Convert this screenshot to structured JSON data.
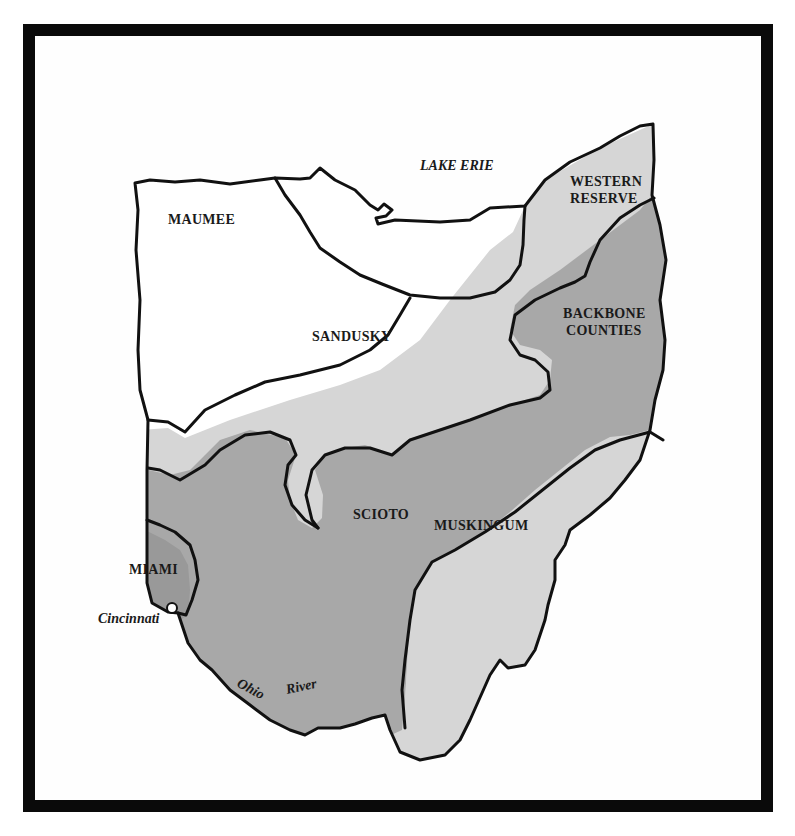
{
  "map": {
    "title": "Ohio settlement regions",
    "colors": {
      "white_region": "#ffffff",
      "light_region": "#d9d9d9",
      "medium_region": "#a9a9a9",
      "dark_region": "#9a9a9a",
      "line": "#111111",
      "frame": "#0a0a0a"
    },
    "water_labels": {
      "lake": "LAKE ERIE",
      "river_part1": "Ohio",
      "river_part2": "River"
    },
    "city_labels": {
      "cincinnati": "Cincinnati"
    },
    "regions": [
      {
        "id": "maumee",
        "label": "MAUMEE",
        "shade": "white"
      },
      {
        "id": "sandusky",
        "label": "SANDUSKY",
        "shade": "white"
      },
      {
        "id": "western-reserve",
        "label_line1": "WESTERN",
        "label_line2": "RESERVE",
        "shade": "light"
      },
      {
        "id": "backbone-counties",
        "label_line1": "BACKBONE",
        "label_line2": "COUNTIES",
        "shade": "medium"
      },
      {
        "id": "scioto",
        "label": "SCIOTO",
        "shade": "medium"
      },
      {
        "id": "muskingum",
        "label": "MUSKINGUM",
        "shade": "light"
      },
      {
        "id": "miami",
        "label": "MIAMI",
        "shade": "dark"
      }
    ]
  }
}
